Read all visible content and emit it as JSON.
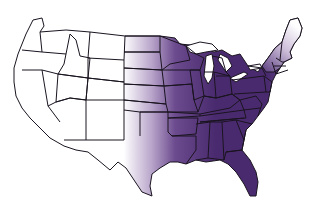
{
  "map": {
    "title": "",
    "region": "Contiguous United States",
    "fill_color": "#4a2a6e",
    "light_fill": "#ffffff",
    "border_color": "#1a1420",
    "gradient_note": "Purple shading covers the eastern/central states, fading to white in the western plains and northern New England"
  }
}
